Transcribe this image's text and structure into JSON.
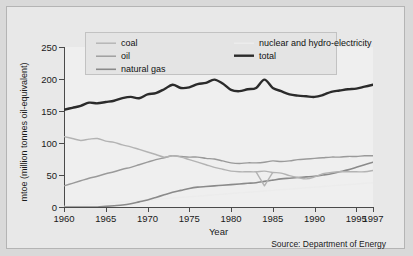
{
  "source_note": "Source: Department of Energy",
  "legend": {
    "items": [
      {
        "label": "coal",
        "color": "#b3b3b3",
        "width": 1.4,
        "key": "coal"
      },
      {
        "label": "oil",
        "color": "#9a9a9a",
        "width": 1.4,
        "key": "oil"
      },
      {
        "label": "natural gas",
        "color": "#8a8a8a",
        "width": 1.6,
        "key": "natural_gas"
      },
      {
        "label": "nuclear and hydro-electricity",
        "color": "#ececec",
        "width": 1.4,
        "key": "nuclear_hydro"
      },
      {
        "label": "total",
        "color": "#2b2b2b",
        "width": 2.4,
        "key": "total"
      }
    ]
  },
  "chart_data": {
    "type": "line",
    "title": "",
    "xlabel": "Year",
    "ylabel": "mtoe (million tonnes oil-equivalent)",
    "xlim": [
      1960,
      1997
    ],
    "ylim": [
      0,
      250
    ],
    "xticks": [
      1960,
      1965,
      1970,
      1975,
      1980,
      1985,
      1990,
      1995,
      1997
    ],
    "xticklabels": [
      "1960",
      "1965",
      "1970",
      "1975",
      "1980",
      "1985",
      "1990",
      "1995",
      "1997"
    ],
    "yticks": [
      0,
      50,
      100,
      150,
      200,
      250
    ],
    "yticklabels": [
      "0",
      "50",
      "100",
      "150",
      "200",
      "250"
    ],
    "grid": false,
    "legend_position": "top",
    "x": [
      1960,
      1961,
      1962,
      1963,
      1964,
      1965,
      1966,
      1967,
      1968,
      1969,
      1970,
      1971,
      1972,
      1973,
      1974,
      1975,
      1976,
      1977,
      1978,
      1979,
      1980,
      1981,
      1982,
      1983,
      1984,
      1985,
      1986,
      1987,
      1988,
      1989,
      1990,
      1991,
      1992,
      1993,
      1994,
      1995,
      1996,
      1997
    ],
    "series": [
      {
        "name": "total",
        "color": "#2b2b2b",
        "values": [
          152,
          155,
          158,
          163,
          162,
          164,
          166,
          170,
          172,
          170,
          176,
          178,
          184,
          191,
          186,
          187,
          192,
          194,
          199,
          193,
          183,
          181,
          184,
          186,
          199,
          186,
          181,
          176,
          174,
          173,
          172,
          175,
          180,
          182,
          184,
          185,
          188,
          191
        ]
      },
      {
        "name": "coal",
        "color": "#b3b3b3",
        "values": [
          110,
          107,
          104,
          106,
          107,
          103,
          101,
          97,
          94,
          90,
          86,
          82,
          78,
          80,
          78,
          74,
          70,
          66,
          62,
          59,
          56,
          55,
          55,
          55,
          56,
          54,
          53,
          49,
          46,
          44,
          47,
          52,
          54,
          55,
          55,
          55,
          55,
          57
        ]
      },
      {
        "name": "oil",
        "color": "#9a9a9a",
        "values": [
          33,
          37,
          41,
          45,
          48,
          52,
          55,
          59,
          62,
          66,
          70,
          74,
          77,
          80,
          79,
          78,
          78,
          76,
          75,
          72,
          69,
          68,
          69,
          69,
          70,
          72,
          71,
          72,
          74,
          75,
          76,
          77,
          78,
          78,
          79,
          79,
          80,
          80
        ]
      },
      {
        "name": "natural_gas",
        "color": "#8a8a8a",
        "values": [
          0,
          0,
          0,
          0,
          0,
          1,
          2,
          3,
          5,
          8,
          11,
          15,
          19,
          23,
          26,
          29,
          31,
          32,
          33,
          34,
          35,
          36,
          37,
          38,
          40,
          42,
          44,
          45,
          46,
          47,
          48,
          50,
          52,
          55,
          58,
          62,
          66,
          70
        ]
      },
      {
        "name": "nuclear_hydro",
        "color": "#ececec",
        "values": [
          1,
          2,
          3,
          4,
          5,
          6,
          7,
          8,
          9,
          10,
          11,
          12,
          13,
          14,
          15,
          16,
          17,
          18,
          19,
          20,
          21,
          22,
          23,
          24,
          25,
          26,
          27,
          28,
          29,
          30,
          31,
          32,
          33,
          34,
          35,
          36,
          37,
          38
        ]
      }
    ],
    "annotations": [
      {
        "note": "coal dips sharply to about 33 mtoe in 1984 (miners' strike) forming a diamond crossing with the oil line",
        "x": 1984,
        "y": 33
      }
    ]
  }
}
